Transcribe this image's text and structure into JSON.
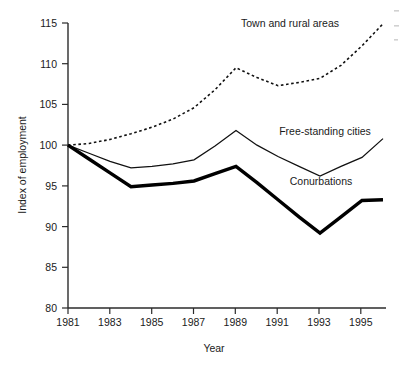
{
  "chart_data": {
    "type": "line",
    "title": "",
    "xlabel": "Year",
    "ylabel": "Index of employment",
    "xlim": [
      1981,
      1996
    ],
    "ylim": [
      80,
      115
    ],
    "grid": false,
    "legend_position": "inline-annotations",
    "x": [
      1981,
      1982,
      1983,
      1984,
      1985,
      1986,
      1987,
      1988,
      1989,
      1990,
      1991,
      1992,
      1993,
      1994,
      1995,
      1996
    ],
    "xticks": [
      1981,
      1983,
      1985,
      1987,
      1989,
      1991,
      1993,
      1995
    ],
    "xticklabels": [
      "1981",
      "1983",
      "1985",
      "1987",
      "1989",
      "1991",
      "1993",
      "1995"
    ],
    "yticks": [
      80,
      85,
      90,
      95,
      100,
      105,
      110,
      115
    ],
    "yticklabels": [
      "80",
      "85",
      "90",
      "95",
      "100",
      "105",
      "110",
      "115"
    ],
    "series": [
      {
        "name": "Town and rural areas",
        "style": "dotted",
        "values": [
          100.0,
          100.2,
          100.7,
          101.4,
          102.2,
          103.2,
          104.6,
          106.8,
          109.5,
          108.3,
          107.3,
          107.7,
          108.2,
          109.8,
          112.2,
          114.9
        ]
      },
      {
        "name": "Free-standing cities",
        "style": "thin-solid",
        "values": [
          100.0,
          99.0,
          98.0,
          97.2,
          97.4,
          97.7,
          98.2,
          99.9,
          101.8,
          100.0,
          98.6,
          97.4,
          96.2,
          97.4,
          98.5,
          100.8
        ]
      },
      {
        "name": "Conurbations",
        "style": "thick-solid",
        "values": [
          100.0,
          98.3,
          96.6,
          94.9,
          95.1,
          95.3,
          95.6,
          96.5,
          97.4,
          95.4,
          93.3,
          91.2,
          89.2,
          91.2,
          93.2,
          93.3
        ]
      }
    ],
    "annotations": [
      {
        "label": "Town and rural areas",
        "for_series": "Town and rural areas"
      },
      {
        "label": "Free-standing cities",
        "for_series": "Free-standing cities"
      },
      {
        "label": "Conurbations",
        "for_series": "Conurbations"
      }
    ]
  }
}
